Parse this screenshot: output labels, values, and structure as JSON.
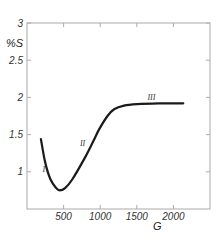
{
  "chart_data": {
    "type": "line",
    "title": "",
    "xlabel": "G",
    "ylabel": "%S",
    "xlim": [
      0,
      2500
    ],
    "ylim": [
      0.5,
      3
    ],
    "x_ticks": [
      500,
      1000,
      1500,
      2000
    ],
    "x_tick_labels": [
      "500",
      "1000",
      "1500",
      "2000"
    ],
    "y_ticks": [
      1,
      1.5,
      2,
      2.5,
      3
    ],
    "y_tick_labels": [
      "1",
      "1.5",
      "2",
      "2.5",
      "3"
    ],
    "grid": false,
    "legend": null,
    "series": [
      {
        "name": "%S vs G",
        "x": [
          190,
          250,
          320,
          400,
          445,
          520,
          620,
          780,
          900,
          985,
          1100,
          1190,
          1325,
          1500,
          1800,
          2135
        ],
        "y": [
          1.44,
          1.12,
          0.9,
          0.78,
          0.75,
          0.78,
          0.9,
          1.17,
          1.4,
          1.57,
          1.75,
          1.84,
          1.89,
          1.91,
          1.92,
          1.92
        ]
      }
    ],
    "annotations": [
      {
        "text": "I",
        "x": 230,
        "y": 1.0
      },
      {
        "text": "II",
        "x": 760,
        "y": 1.35
      },
      {
        "text": "III",
        "x": 1700,
        "y": 1.96
      }
    ]
  }
}
